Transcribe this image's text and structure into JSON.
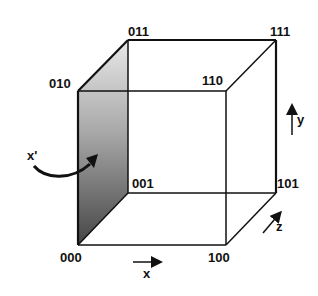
{
  "diagram": {
    "type": "3D unit cube with binary-labeled vertices",
    "vertices": [
      {
        "label": "000",
        "x": 78,
        "y": 245,
        "lx": 60,
        "ly": 262
      },
      {
        "label": "001",
        "x": 128,
        "y": 193,
        "lx": 132,
        "ly": 188
      },
      {
        "label": "010",
        "x": 78,
        "y": 91,
        "lx": 49,
        "ly": 88
      },
      {
        "label": "011",
        "x": 128,
        "y": 40,
        "lx": 128,
        "ly": 36
      },
      {
        "label": "100",
        "x": 226,
        "y": 245,
        "lx": 208,
        "ly": 262
      },
      {
        "label": "101",
        "x": 276,
        "y": 193,
        "lx": 277,
        "ly": 188
      },
      {
        "label": "110",
        "x": 226,
        "y": 91,
        "lx": 202,
        "ly": 85
      },
      {
        "label": "111",
        "x": 276,
        "y": 40,
        "lx": 270,
        "ly": 36
      }
    ],
    "shaded_face": {
      "name": "x=0 face",
      "vertices": [
        "000",
        "010",
        "011",
        "001"
      ],
      "gradient_top": "#e6e6e6",
      "gradient_bottom": "#4a4a4a"
    },
    "rotation_label": "x'",
    "axes": {
      "x": {
        "label": "x"
      },
      "y": {
        "label": "y"
      },
      "z": {
        "label": "z"
      }
    },
    "colors": {
      "line": "#111111",
      "background": "#ffffff"
    }
  }
}
